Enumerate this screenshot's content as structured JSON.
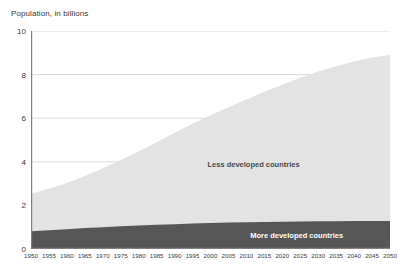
{
  "chart": {
    "axis_title": "Population, in billions",
    "y_ticks": [
      0,
      2,
      4,
      6,
      8,
      10
    ],
    "series_labels": {
      "less": "Less developed countries",
      "more": "More developed countries"
    },
    "colors": {
      "less_developed": "#e3e3e3",
      "more_developed": "#565656",
      "gridline": "#dcdcdc",
      "axis": "#808080",
      "text": "#3a3a3a"
    }
  },
  "chart_data": {
    "type": "area",
    "title": "Population, in billions",
    "xlabel": "",
    "ylabel": "Population, in billions",
    "xlim": [
      1950,
      2050
    ],
    "ylim": [
      0,
      10
    ],
    "grid": true,
    "stacked": true,
    "legend": "inline-labels",
    "x": [
      1950,
      1955,
      1960,
      1965,
      1970,
      1975,
      1980,
      1985,
      1990,
      1995,
      2000,
      2005,
      2010,
      2015,
      2020,
      2025,
      2030,
      2035,
      2040,
      2045,
      2050
    ],
    "series": [
      {
        "name": "More developed countries",
        "values": [
          0.81,
          0.86,
          0.91,
          0.96,
          1.0,
          1.04,
          1.08,
          1.11,
          1.14,
          1.17,
          1.19,
          1.21,
          1.23,
          1.24,
          1.25,
          1.26,
          1.27,
          1.27,
          1.28,
          1.28,
          1.28
        ]
      },
      {
        "name": "Less developed countries",
        "values": [
          1.72,
          1.9,
          2.12,
          2.39,
          2.7,
          3.04,
          3.39,
          3.79,
          4.19,
          4.58,
          4.94,
          5.29,
          5.63,
          5.97,
          6.29,
          6.59,
          6.87,
          7.11,
          7.32,
          7.5,
          7.62
        ]
      }
    ],
    "totals": [
      2.53,
      2.76,
      3.03,
      3.35,
      3.7,
      4.08,
      4.47,
      4.9,
      5.33,
      5.75,
      6.13,
      6.5,
      6.86,
      7.21,
      7.54,
      7.85,
      8.14,
      8.38,
      8.6,
      8.78,
      8.9
    ],
    "y_ticks": [
      0,
      2,
      4,
      6,
      8,
      10
    ],
    "x_ticks": [
      1950,
      1955,
      1960,
      1965,
      1970,
      1975,
      1980,
      1985,
      1990,
      1995,
      2000,
      2005,
      2010,
      2015,
      2020,
      2025,
      2030,
      2035,
      2040,
      2045,
      2050
    ],
    "annotations": [
      {
        "text": "Less developed countries",
        "x": 2012,
        "y": 3.9
      },
      {
        "text": "More developed countries",
        "x": 2024,
        "y": 0.62
      }
    ]
  }
}
